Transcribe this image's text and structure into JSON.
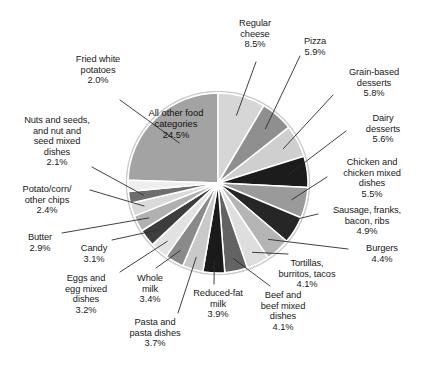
{
  "chart_data": {
    "type": "pie",
    "title": "",
    "subtitle": "",
    "xlabel": "",
    "ylabel": "",
    "legend_position": "none",
    "grid": false,
    "units": "percent",
    "start_angle_deg": 0,
    "note": "Slice at 12 o'clock is 'All other food categories' drawn counter-clockwise; all remaining slices proceed clockwise from 12 o'clock.",
    "categories": [
      "All other food categories",
      "Regular cheese",
      "Pizza",
      "Grain-based desserts",
      "Dairy desserts",
      "Chicken and chicken mixed dishes",
      "Sausage, franks, bacon, ribs",
      "Burgers",
      "Tortillas, burritos, tacos",
      "Beef and beef mixed dishes",
      "Reduced-fat milk",
      "Pasta and pasta dishes",
      "Whole milk",
      "Eggs and egg mixed dishes",
      "Candy",
      "Butter",
      "Potato/corn/other chips",
      "Nuts and seeds, and nut and seed mixed dishes",
      "Fried white potatoes"
    ],
    "values": [
      24.5,
      8.5,
      5.9,
      5.8,
      5.6,
      5.5,
      4.9,
      4.4,
      4.1,
      4.1,
      3.9,
      3.7,
      3.4,
      3.2,
      3.1,
      2.9,
      2.4,
      2.1,
      2.0
    ],
    "value_labels": [
      "24.5%",
      "8.5%",
      "5.9%",
      "5.8%",
      "5.6%",
      "5.5%",
      "4.9%",
      "4.4%",
      "4.1%",
      "4.1%",
      "3.9%",
      "3.7%",
      "3.4%",
      "3.2%",
      "3.1%",
      "2.9%",
      "2.4%",
      "2.1%",
      "2.0%"
    ],
    "slice_colors": [
      "#a3a3a3",
      "#d6d6d6",
      "#8f8f8f",
      "#cfcfcf",
      "#1c1c1c",
      "#9a9a9a",
      "#262626",
      "#b5b5b5",
      "#dedede",
      "#636363",
      "#1a1a1a",
      "#c9c9c9",
      "#8a8a8a",
      "#e2e2e2",
      "#3d3d3d",
      "#b0b0b0",
      "#dadada",
      "#6e6e6e",
      "#eeeeee"
    ],
    "slice_separator_color": "#ffffff",
    "pie_outline_color": "#cccccc",
    "label_text_color": "#1a1a1a",
    "leader_line_color": "#2b2b2b",
    "background_color": "#ffffff"
  },
  "labels": {
    "all_other": "All other food\ncategories\n24.5%",
    "regular_cheese": "Regular\ncheese\n8.5%",
    "pizza": "Pizza\n5.9%",
    "grain_based_desserts": "Grain-based\ndesserts\n5.8%",
    "dairy_desserts": "Dairy\ndesserts\n5.6%",
    "chicken": "Chicken and\nchicken mixed\ndishes\n5.5%",
    "sausage": "Sausage, franks,\nbacon, ribs\n4.9%",
    "burgers": "Burgers\n4.4%",
    "tortillas": "Tortillas,\nburritos, tacos\n4.1%",
    "beef": "Beef and\nbeef mixed\ndishes\n4.1%",
    "reduced_fat_milk": "Reduced-fat\nmilk\n3.9%",
    "pasta": "Pasta and\npasta dishes\n3.7%",
    "whole_milk": "Whole\nmilk\n3.4%",
    "eggs": "Eggs and\negg mixed\ndishes\n3.2%",
    "candy": "Candy\n3.1%",
    "butter": "Butter\n2.9%",
    "chips": "Potato/corn/\nother chips\n2.4%",
    "nuts": "Nuts and seeds,\nand nut and\nseed mixed\ndishes\n2.1%",
    "fried_white_potatoes": "Fried white\npotatoes\n2.0%"
  }
}
